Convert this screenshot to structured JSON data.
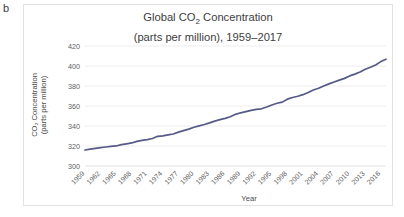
{
  "panel": {
    "label": "b"
  },
  "colors": {
    "line": "#555a86",
    "grid": "#e8e8ea",
    "text": "#4a4a4a",
    "border": "#e2e2e2",
    "background": "#ffffff"
  },
  "chart_data": {
    "type": "line",
    "subtitle": "(parts per million), 1959–2017",
    "title_line1": "Global CO",
    "title_sub": "2",
    "title_line1_rest": " Concentration",
    "title_line2": "(parts per million), 1959–2017",
    "xlabel": "Year",
    "ylabel_line1": "CO₂ Concentration",
    "ylabel_line2": "(parts per million)",
    "ylabel": "CO₂ Concentration (parts per million)",
    "grid": true,
    "legend": false,
    "ylim": [
      300,
      420
    ],
    "yticks": [
      300,
      320,
      340,
      360,
      380,
      400,
      420
    ],
    "ytick_labels": [
      "300",
      "320",
      "340",
      "360",
      "380",
      "400",
      "420"
    ],
    "xlim": [
      1959,
      2017
    ],
    "xticks": [
      1959,
      1962,
      1965,
      1968,
      1971,
      1974,
      1977,
      1980,
      1983,
      1986,
      1989,
      1992,
      1995,
      1998,
      2001,
      2004,
      2007,
      2010,
      2013,
      2016
    ],
    "xtick_labels": [
      "1959",
      "1962",
      "1965",
      "1968",
      "1971",
      "1974",
      "1977",
      "1980",
      "1983",
      "1986",
      "1989",
      "1992",
      "1995",
      "1998",
      "2001",
      "2004",
      "2007",
      "2010",
      "2013",
      "2016"
    ],
    "x": [
      1959,
      1960,
      1961,
      1962,
      1963,
      1964,
      1965,
      1966,
      1967,
      1968,
      1969,
      1970,
      1971,
      1972,
      1973,
      1974,
      1975,
      1976,
      1977,
      1978,
      1979,
      1980,
      1981,
      1982,
      1983,
      1984,
      1985,
      1986,
      1987,
      1988,
      1989,
      1990,
      1991,
      1992,
      1993,
      1994,
      1995,
      1996,
      1997,
      1998,
      1999,
      2000,
      2001,
      2002,
      2003,
      2004,
      2005,
      2006,
      2007,
      2008,
      2009,
      2010,
      2011,
      2012,
      2013,
      2014,
      2015,
      2016,
      2017
    ],
    "values": [
      315.98,
      316.91,
      317.64,
      318.45,
      318.99,
      319.62,
      320.04,
      321.37,
      322.18,
      323.05,
      324.62,
      325.68,
      326.32,
      327.46,
      329.68,
      330.19,
      331.12,
      332.03,
      333.84,
      335.41,
      336.84,
      338.76,
      340.12,
      341.48,
      343.15,
      344.85,
      346.35,
      347.61,
      349.31,
      351.69,
      353.2,
      354.45,
      355.7,
      356.54,
      357.21,
      358.96,
      360.97,
      362.74,
      363.88,
      366.84,
      368.54,
      369.71,
      371.32,
      373.45,
      375.98,
      377.7,
      379.98,
      382.09,
      384.02,
      385.83,
      387.64,
      390.1,
      391.85,
      394.06,
      396.74,
      398.81,
      401.01,
      404.41,
      406.76
    ],
    "series_name": "Global CO₂ Concentration"
  }
}
